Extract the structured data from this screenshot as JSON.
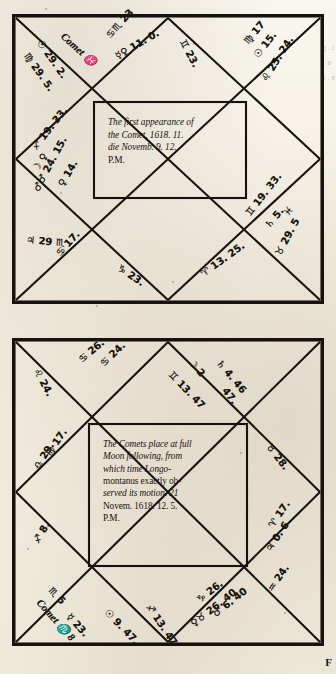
{
  "page": {
    "signature_mark": "F",
    "bleed_through": "g . t c a a . e"
  },
  "charts": [
    {
      "id": "chart-first-appearance",
      "center_text_lines": [
        "The first appearance of",
        "the Comet, 1618. 11.",
        "die Novemb. 9. 12.",
        "P.M."
      ],
      "labels": [
        {
          "name": "comet-pisces",
          "text": "Comet ♓",
          "x": 50,
          "y": 16,
          "rot": 42
        },
        {
          "name": "sun-29-2",
          "text": "☉ 29. 2.",
          "x": 27,
          "y": 22,
          "rot": 55
        },
        {
          "name": "virgo-29-5",
          "text": "♍ 29. 5.",
          "x": 14,
          "y": 35,
          "rot": 55
        },
        {
          "name": "cancer-scorpio-23",
          "text": "♋♏ 23",
          "x": 96,
          "y": 18,
          "rot": -48
        },
        {
          "name": "mercury-venus-11-0",
          "text": "☿♀ 11. 0.",
          "x": 104,
          "y": 38,
          "rot": -30
        },
        {
          "name": "gemini-23",
          "text": "♊ 23.",
          "x": 170,
          "y": 21,
          "rot": 62
        },
        {
          "name": "virgo-17",
          "text": "♍ 17",
          "x": 234,
          "y": 24,
          "rot": -50
        },
        {
          "name": "sun-15",
          "text": "☉ 15.",
          "x": 244,
          "y": 38,
          "rot": -52
        },
        {
          "name": "leo-25-24",
          "text": "♌ 25. 24.",
          "x": 252,
          "y": 62,
          "rot": -58
        },
        {
          "name": "sagittarius-19-33",
          "text": "♐ 19. 33.",
          "x": 22,
          "y": 130,
          "rot": -52
        },
        {
          "name": "moon-venus",
          "text": "☽ ♀",
          "x": 23,
          "y": 152,
          "rot": -58
        },
        {
          "name": "venus-14",
          "text": "♀ 14.",
          "x": 49,
          "y": 167,
          "rot": -60
        },
        {
          "name": "mars-24-15",
          "text": "♂♂ 24. 15.",
          "x": 24,
          "y": 172,
          "rot": -62
        },
        {
          "name": "jupiter-29-scorpio",
          "text": "♃ 29 ♏",
          "x": 14,
          "y": 221,
          "rot": 5
        },
        {
          "name": "cancer-17",
          "text": "♋ 17.",
          "x": 46,
          "y": 236,
          "rot": -48
        },
        {
          "name": "capricorn-23",
          "text": "♑ 23.",
          "x": 106,
          "y": 248,
          "rot": 34
        },
        {
          "name": "aries-13-25",
          "text": "♈ 13. 25.",
          "x": 190,
          "y": 256,
          "rot": -36
        },
        {
          "name": "gemini-19-33",
          "text": "♊ 19. 33.",
          "x": 236,
          "y": 196,
          "rot": -52
        },
        {
          "name": "saturn-5",
          "text": "♄ 5.",
          "x": 255,
          "y": 208,
          "rot": -50
        },
        {
          "name": "pisces-sym",
          "text": "♓",
          "x": 274,
          "y": 196,
          "rot": -52
        },
        {
          "name": "taurus-29-5",
          "text": "♉ 29. 5",
          "x": 266,
          "y": 236,
          "rot": -62
        }
      ]
    },
    {
      "id": "chart-full-moon-place",
      "center_text_lines": [
        "The Comets place at full",
        "Moon following, from",
        "which  time   Longo-",
        "montanus exactly ob-",
        "served its motion. 21",
        "Novem. 1618. 12. 5.",
        "P.M."
      ],
      "labels": [
        {
          "name": "leo-24",
          "text": "♌ 24.",
          "x": 24,
          "y": 26,
          "rot": 62
        },
        {
          "name": "cancer-26",
          "text": "♋ 26.",
          "x": 68,
          "y": 18,
          "rot": -40
        },
        {
          "name": "cancer-24",
          "text": "♋ 24.",
          "x": 90,
          "y": 22,
          "rot": -44
        },
        {
          "name": "gemini-13-47",
          "text": "♊ 13. 47",
          "x": 158,
          "y": 30,
          "rot": 46
        },
        {
          "name": "moon-2",
          "text": "☽ 2",
          "x": 178,
          "y": 18,
          "rot": 48
        },
        {
          "name": "saturn-4-46",
          "text": "♄ 4. 46",
          "x": 206,
          "y": 18,
          "rot": 50
        },
        {
          "name": "forty-seven",
          "text": "47.",
          "x": 212,
          "y": 46,
          "rot": 52
        },
        {
          "name": "taurus-28",
          "text": "♉ 28.",
          "x": 256,
          "y": 102,
          "rot": 52
        },
        {
          "name": "virgo-17",
          "text": "♍ 17.",
          "x": 36,
          "y": 112,
          "rot": -56
        },
        {
          "name": "libra-29",
          "text": "♎ 29.",
          "x": 24,
          "y": 126,
          "rot": -58
        },
        {
          "name": "sagittarius-8",
          "text": "♐ 8.",
          "x": 24,
          "y": 200,
          "rot": -60
        },
        {
          "name": "aries-17",
          "text": "♈ 17.",
          "x": 259,
          "y": 184,
          "rot": -56
        },
        {
          "name": "jupiter-0-6",
          "text": "♃ 0. 6",
          "x": 256,
          "y": 208,
          "rot": -56
        },
        {
          "name": "aquarius-24",
          "text": "♒ 24.",
          "x": 258,
          "y": 248,
          "rot": -56
        },
        {
          "name": "scorpio-5",
          "text": "♏ 5",
          "x": 38,
          "y": 246,
          "rot": 46
        },
        {
          "name": "comet-scorpio-8",
          "text": "Comet ♏ 8",
          "x": 26,
          "y": 258,
          "rot": 48
        },
        {
          "name": "mercury-23",
          "text": "☿ 23.",
          "x": 56,
          "y": 272,
          "rot": 48
        },
        {
          "name": "sun-9-47",
          "text": "☉ 9. 47.",
          "x": 94,
          "y": 268,
          "rot": 46
        },
        {
          "name": "sagittarius-13-47",
          "text": "♐ 13. 47",
          "x": 136,
          "y": 262,
          "rot": 56
        },
        {
          "name": "capricorn-26",
          "text": "♑ 26.",
          "x": 186,
          "y": 258,
          "rot": -38
        },
        {
          "name": "mars-6-40",
          "text": "♂ 6. 40",
          "x": 202,
          "y": 272,
          "rot": -38
        },
        {
          "name": "venus-26-40",
          "text": "♀♉ 26. 40",
          "x": 180,
          "y": 282,
          "rot": -38
        }
      ]
    }
  ]
}
